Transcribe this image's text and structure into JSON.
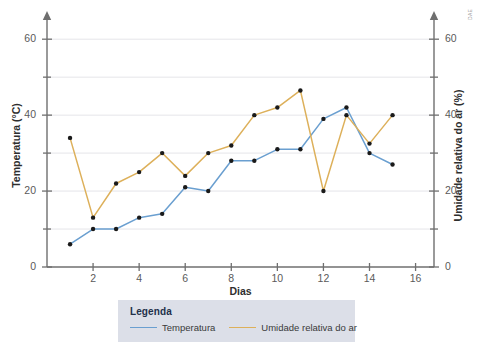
{
  "figure": {
    "credit": "DAE",
    "background": "#ffffff"
  },
  "legend": {
    "title": "Legenda",
    "entries": [
      {
        "label": "Temperatura",
        "color": "#6a9fd0"
      },
      {
        "label": "Umidade relativa do ar",
        "color": "#ddb05a"
      }
    ]
  },
  "chart_data": {
    "type": "line",
    "title": "",
    "xlabel": "Dias",
    "ylabel": "Temperatura (°C)",
    "y2label": "Umidade relativa do ar (%)",
    "x": [
      1,
      2,
      3,
      4,
      5,
      6,
      7,
      8,
      9,
      10,
      11,
      12,
      13,
      14,
      15
    ],
    "xlim": [
      0,
      16.8
    ],
    "ylim": [
      0,
      64
    ],
    "y2lim": [
      0,
      64
    ],
    "xticks": [
      2,
      4,
      6,
      8,
      10,
      12,
      14,
      16
    ],
    "yticks": [
      0,
      20,
      40,
      60
    ],
    "yticks_minor": [
      10,
      30,
      50
    ],
    "y2ticks": [
      0,
      20,
      40,
      60
    ],
    "y2ticks_minor": [
      10,
      30,
      50
    ],
    "grid": true,
    "legend_position": "below",
    "series": [
      {
        "name": "Temperatura",
        "color": "#6a9fd0",
        "axis": "left",
        "unit": "°C",
        "values": [
          6,
          10,
          10,
          13,
          14,
          21,
          20,
          28,
          28,
          31,
          31,
          39,
          42,
          30,
          27
        ]
      },
      {
        "name": "Umidade relativa do ar",
        "color": "#ddb05a",
        "axis": "right",
        "unit": "%",
        "values": [
          34,
          13,
          22,
          25,
          30,
          24,
          30,
          32,
          40,
          42,
          46.5,
          20,
          40,
          32.5,
          40
        ]
      }
    ]
  }
}
